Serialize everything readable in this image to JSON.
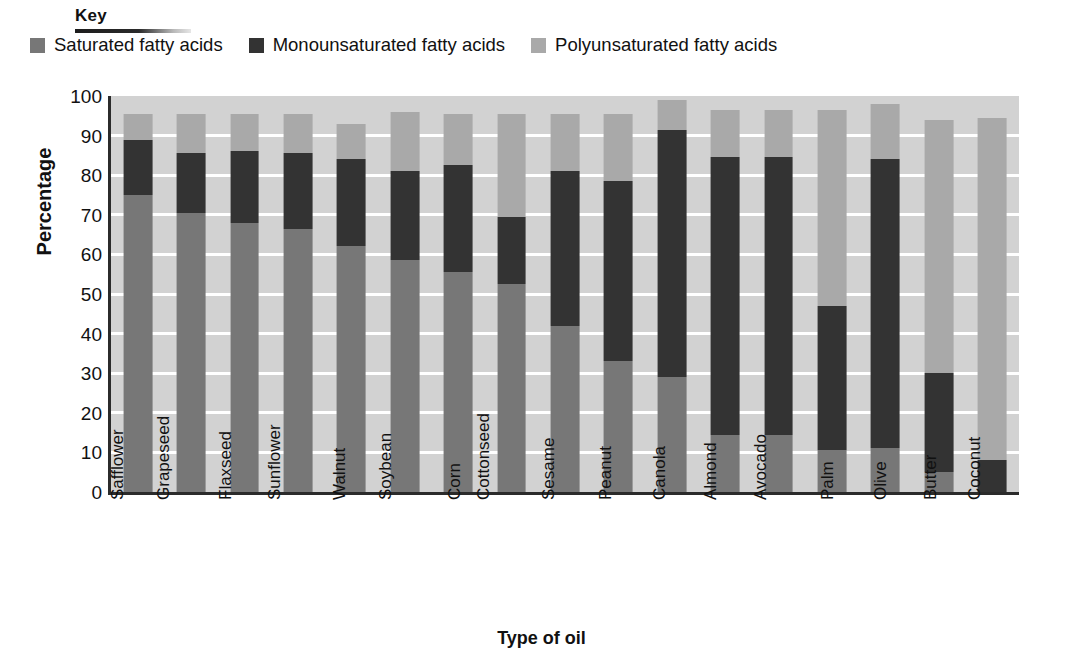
{
  "key": {
    "title": "Key",
    "legend": [
      {
        "label": "Saturated fatty acids",
        "color": "#777777",
        "icon": "legend-swatch-icon"
      },
      {
        "label": "Monounsaturated fatty acids",
        "color": "#333333",
        "icon": "legend-swatch-icon"
      },
      {
        "label": "Polyunsaturated fatty acids",
        "color": "#a9a9a9",
        "icon": "legend-swatch-icon"
      }
    ]
  },
  "axes": {
    "y_title": "Percentage",
    "x_title": "Type of oil",
    "y_ticks": [
      "100",
      "90",
      "80",
      "70",
      "60",
      "50",
      "40",
      "30",
      "20",
      "10",
      "0"
    ]
  },
  "chart_data": {
    "type": "bar",
    "subtype": "stacked-vertical",
    "title": "",
    "xlabel": "Type of oil",
    "ylabel": "Percentage",
    "ylim": [
      0,
      100
    ],
    "ytick_step": 10,
    "grid": true,
    "legend_position": "top",
    "stack_order_bottom_to_top": [
      "Saturated fatty acids",
      "Monounsaturated fatty acids",
      "Polyunsaturated fatty acids"
    ],
    "categories": [
      "Safflower",
      "Grapeseed",
      "Flaxseed",
      "Sunflower",
      "Walnut",
      "Soybean",
      "Corn",
      "Cottonseed",
      "Sesame",
      "Peanut",
      "Canola",
      "Almond",
      "Avocado",
      "Palm",
      "Olive",
      "Butter",
      "Coconut"
    ],
    "series": [
      {
        "name": "Saturated fatty acids",
        "color": "#777777",
        "values": [
          75,
          70.5,
          68,
          66.5,
          62,
          58.5,
          55.5,
          52.5,
          42,
          33,
          29,
          14.5,
          14.5,
          10.5,
          11,
          5,
          0
        ]
      },
      {
        "name": "Monounsaturated fatty acids",
        "color": "#333333",
        "values": [
          14,
          15,
          18,
          19,
          22,
          22.5,
          27,
          17,
          39,
          45.5,
          62.5,
          70,
          70,
          36.5,
          73,
          25,
          8
        ]
      },
      {
        "name": "Polyunsaturated fatty acids",
        "color": "#a9a9a9",
        "values": [
          6.5,
          10,
          9.5,
          10,
          9,
          15,
          13,
          26,
          14.5,
          17,
          7.5,
          12,
          12,
          49.5,
          14,
          64,
          86.5
        ]
      }
    ],
    "totals": [
      95.5,
      95.5,
      95.5,
      95.5,
      93,
      96,
      95.5,
      95.5,
      95.5,
      95.5,
      99,
      96.5,
      96.5,
      96.5,
      98,
      94,
      94.5
    ]
  },
  "colors": {
    "plot_background": "#d2d2d2",
    "gridline": "#ffffff",
    "axis": "#2b2b2b",
    "text": "#111111"
  }
}
